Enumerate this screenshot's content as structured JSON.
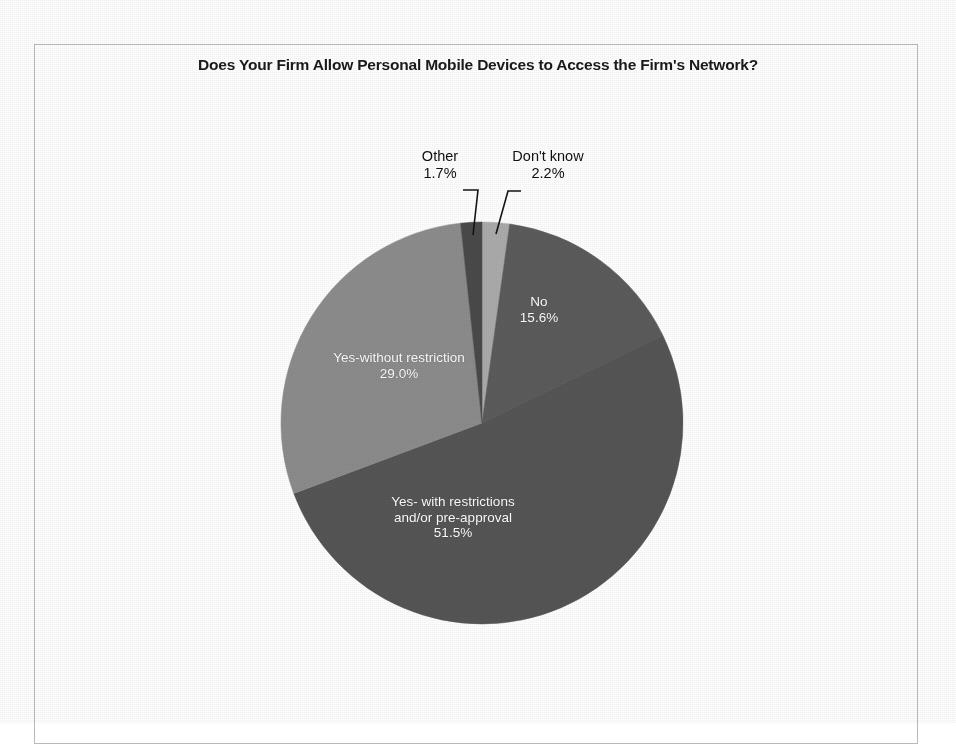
{
  "chart_data": {
    "type": "pie",
    "title": "Does Your Firm Allow Personal Mobile Devices to Access the Firm's Network?",
    "xlabel": "",
    "ylabel": "",
    "legend": "none",
    "grid": false,
    "categories": [
      "Don't know",
      "No",
      "Yes- with restrictions and/or pre-approval",
      "Yes-without restriction",
      "Other"
    ],
    "values": [
      2.2,
      15.6,
      51.5,
      29.0,
      1.7
    ],
    "value_labels": [
      "2.2%",
      "15.6%",
      "51.5%",
      "29.0%",
      "1.7%"
    ],
    "unit": "%",
    "start_angle_deg": 0,
    "direction": "clockwise",
    "slices": [
      {
        "name": "Don't know",
        "value": 2.2,
        "value_label": "2.2%",
        "color": "#ababab",
        "label_text": "Don't know",
        "label_placement": "callout-outside",
        "label_color": "#111111"
      },
      {
        "name": "No",
        "value": 15.6,
        "value_label": "15.6%",
        "color": "#5b5b5b",
        "label_text": "No",
        "label_placement": "inside",
        "label_color": "#ffffff"
      },
      {
        "name": "Yes- with restrictions and/or pre-approval",
        "value": 51.5,
        "value_label": "51.5%",
        "color": "#555555",
        "label_line_1": "Yes- with restrictions",
        "label_line_2": "and/or pre-approval",
        "label_placement": "inside",
        "label_color": "#ffffff"
      },
      {
        "name": "Yes-without restriction",
        "value": 29.0,
        "value_label": "29.0%",
        "color": "#8c8c8c",
        "label_text": "Yes-without restriction",
        "label_placement": "inside",
        "label_color": "#ffffff"
      },
      {
        "name": "Other",
        "value": 1.7,
        "value_label": "1.7%",
        "color": "#4a4a4a",
        "label_text": "Other",
        "label_placement": "callout-outside",
        "label_color": "#111111"
      }
    ],
    "colors": {
      "slice_dark": "#5b5b5b",
      "slice_darkest": "#4a4a4a",
      "slice_medium": "#8c8c8c",
      "slice_light": "#ababab",
      "background": "#ffffff",
      "title_text": "#1a1a1a",
      "callout_text": "#111111",
      "inside_text": "#ffffff",
      "frame_border": "#b9b9b9",
      "leader_line": "#151515"
    }
  }
}
